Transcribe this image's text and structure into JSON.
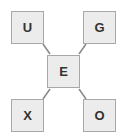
{
  "diagram": {
    "center": {
      "label": "E"
    },
    "nodes": [
      {
        "position": "top-left",
        "label": "U"
      },
      {
        "position": "top-right",
        "label": "G"
      },
      {
        "position": "bottom-left",
        "label": "X"
      },
      {
        "position": "bottom-right",
        "label": "O"
      }
    ],
    "colors": {
      "box_fill": "#ececec",
      "box_border": "#a8a8a8",
      "line": "#888888",
      "text": "#333333"
    }
  }
}
